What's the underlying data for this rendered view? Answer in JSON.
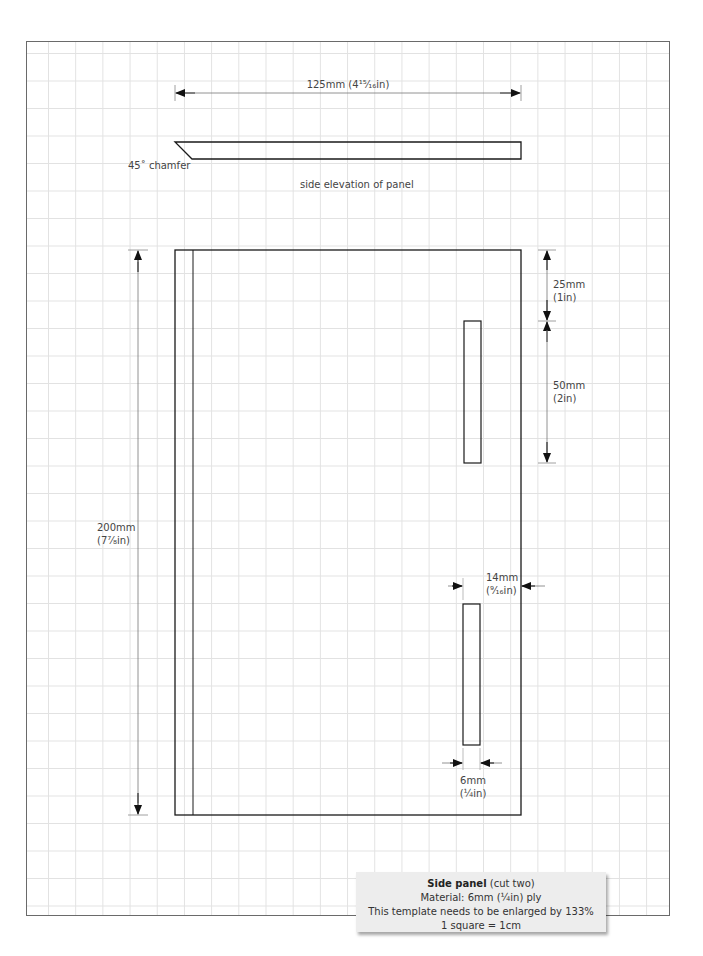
{
  "overall_width": {
    "label": "125mm (4¹⁵⁄₁₆in)"
  },
  "side_elevation": {
    "chamfer_label": "45˚ chamfer",
    "caption": "side elevation of panel"
  },
  "height_dimension": {
    "mm": "200mm",
    "in": "(7⁷⁄₈in)"
  },
  "top_offset": {
    "mm": "25mm",
    "in": "(1in)"
  },
  "slot_length": {
    "mm": "50mm",
    "in": "(2in)"
  },
  "slot_offset": {
    "mm": "14mm",
    "in": "(⁹⁄₁₆in)"
  },
  "slot_width": {
    "mm": "6mm",
    "in": "(¼in)"
  },
  "caption": {
    "title_bold": "Side panel",
    "title_rest": " (cut two)",
    "material": "Material:  6mm (¼in) ply",
    "enlarge": "This template needs to be enlarged by 133%",
    "scale": "1 square = 1cm"
  },
  "colors": {
    "line": "#1a1a1a",
    "grid": "#e2e2e2",
    "caption_bg": "#ededed"
  }
}
